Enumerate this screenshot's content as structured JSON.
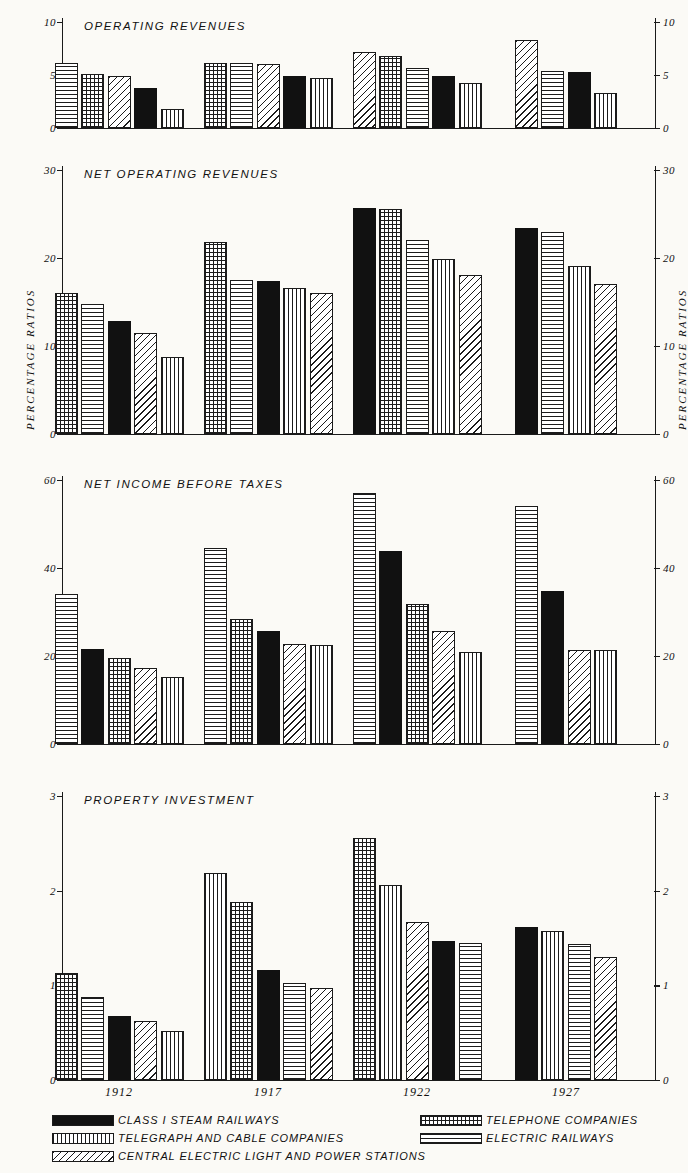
{
  "axis_titles": {
    "left": "PERCENTAGE  RATIOS",
    "right": "PERCENTAGE  RATIOS"
  },
  "years": [
    "1912",
    "1917",
    "1922",
    "1927"
  ],
  "legend": {
    "items": [
      {
        "key": "black",
        "pattern": "solid-black",
        "label": "CLASS I STEAM RAILWAYS"
      },
      {
        "key": "vert",
        "pattern": "vertical-lines",
        "label": "TELEGRAPH AND CABLE COMPANIES"
      },
      {
        "key": "diag",
        "pattern": "diagonal-hatch",
        "label": "CENTRAL ELECTRIC LIGHT AND POWER STATIONS"
      },
      {
        "key": "check",
        "pattern": "checkered",
        "label": "TELEPHONE COMPANIES"
      },
      {
        "key": "horz",
        "pattern": "horizontal-lines",
        "label": "ELECTRIC RAILWAYS"
      }
    ]
  },
  "chart_data": [
    {
      "type": "bar",
      "title": "OPERATING REVENUES",
      "xlabel": "",
      "ylabel": "PERCENTAGE RATIOS",
      "ylim": [
        0,
        10
      ],
      "yticks": [
        0,
        5,
        10
      ],
      "ytick_labels": [
        "0",
        "5",
        "10"
      ],
      "categories": [
        "1912",
        "1917",
        "1922",
        "1927"
      ],
      "groups": [
        {
          "year": "1912",
          "bars": [
            {
              "series": "ELECTRIC RAILWAYS",
              "pattern": "horz",
              "value": 6.1
            },
            {
              "series": "TELEPHONE COMPANIES",
              "pattern": "check",
              "value": 5.1
            },
            {
              "series": "CENTRAL ELECTRIC LIGHT AND POWER STATIONS",
              "pattern": "diag",
              "value": 4.95
            },
            {
              "series": "CLASS I STEAM RAILWAYS",
              "pattern": "black",
              "value": 3.8
            },
            {
              "series": "TELEGRAPH AND CABLE COMPANIES",
              "pattern": "vert",
              "value": 1.8
            }
          ]
        },
        {
          "year": "1917",
          "bars": [
            {
              "series": "TELEPHONE COMPANIES",
              "pattern": "check",
              "value": 6.15
            },
            {
              "series": "ELECTRIC RAILWAYS",
              "pattern": "horz",
              "value": 6.1
            },
            {
              "series": "CENTRAL ELECTRIC LIGHT AND POWER STATIONS",
              "pattern": "diag",
              "value": 6.05
            },
            {
              "series": "CLASS I STEAM RAILWAYS",
              "pattern": "black",
              "value": 4.9
            },
            {
              "series": "TELEGRAPH AND CABLE COMPANIES",
              "pattern": "vert",
              "value": 4.75
            }
          ]
        },
        {
          "year": "1922",
          "bars": [
            {
              "series": "CENTRAL ELECTRIC LIGHT AND POWER STATIONS",
              "pattern": "diag",
              "value": 7.2
            },
            {
              "series": "TELEPHONE COMPANIES",
              "pattern": "check",
              "value": 6.8
            },
            {
              "series": "ELECTRIC RAILWAYS",
              "pattern": "horz",
              "value": 5.7
            },
            {
              "series": "CLASS I STEAM RAILWAYS",
              "pattern": "black",
              "value": 4.9
            },
            {
              "series": "TELEGRAPH AND CABLE COMPANIES",
              "pattern": "vert",
              "value": 4.2
            }
          ]
        },
        {
          "year": "1927",
          "bars": [
            {
              "series": "CENTRAL ELECTRIC LIGHT AND POWER STATIONS",
              "pattern": "diag",
              "value": 8.3
            },
            {
              "series": "ELECTRIC RAILWAYS",
              "pattern": "horz",
              "value": 5.4
            },
            {
              "series": "CLASS I STEAM RAILWAYS",
              "pattern": "black",
              "value": 5.3
            },
            {
              "series": "TELEGRAPH AND CABLE COMPANIES",
              "pattern": "vert",
              "value": 3.3
            }
          ]
        }
      ]
    },
    {
      "type": "bar",
      "title": "NET OPERATING REVENUES",
      "xlabel": "",
      "ylabel": "PERCENTAGE RATIOS",
      "ylim": [
        0,
        30
      ],
      "yticks": [
        0,
        10,
        20,
        30
      ],
      "ytick_labels": [
        "0",
        "10",
        "20",
        "30"
      ],
      "categories": [
        "1912",
        "1917",
        "1922",
        "1927"
      ],
      "groups": [
        {
          "year": "1912",
          "bars": [
            {
              "series": "TELEPHONE COMPANIES",
              "pattern": "check",
              "value": 16.0
            },
            {
              "series": "ELECTRIC RAILWAYS",
              "pattern": "horz",
              "value": 14.8
            },
            {
              "series": "CLASS I STEAM RAILWAYS",
              "pattern": "black",
              "value": 12.8
            },
            {
              "series": "CENTRAL ELECTRIC LIGHT AND POWER STATIONS",
              "pattern": "diag",
              "value": 11.5
            },
            {
              "series": "TELEGRAPH AND CABLE COMPANIES",
              "pattern": "vert",
              "value": 8.8
            }
          ]
        },
        {
          "year": "1917",
          "bars": [
            {
              "series": "TELEPHONE COMPANIES",
              "pattern": "check",
              "value": 21.8
            },
            {
              "series": "ELECTRIC RAILWAYS",
              "pattern": "horz",
              "value": 17.5
            },
            {
              "series": "CLASS I STEAM RAILWAYS",
              "pattern": "black",
              "value": 17.4
            },
            {
              "series": "TELEGRAPH AND CABLE COMPANIES",
              "pattern": "vert",
              "value": 16.6
            },
            {
              "series": "CENTRAL ELECTRIC LIGHT AND POWER STATIONS",
              "pattern": "diag",
              "value": 16.0
            }
          ]
        },
        {
          "year": "1922",
          "bars": [
            {
              "series": "CLASS I STEAM RAILWAYS",
              "pattern": "black",
              "value": 25.7
            },
            {
              "series": "TELEPHONE COMPANIES",
              "pattern": "check",
              "value": 25.6
            },
            {
              "series": "ELECTRIC RAILWAYS",
              "pattern": "horz",
              "value": 22.1
            },
            {
              "series": "TELEGRAPH AND CABLE COMPANIES",
              "pattern": "vert",
              "value": 19.9
            },
            {
              "series": "CENTRAL ELECTRIC LIGHT AND POWER STATIONS",
              "pattern": "diag",
              "value": 18.1
            }
          ]
        },
        {
          "year": "1927",
          "bars": [
            {
              "series": "CLASS I STEAM RAILWAYS",
              "pattern": "black",
              "value": 23.4
            },
            {
              "series": "ELECTRIC RAILWAYS",
              "pattern": "horz",
              "value": 22.9
            },
            {
              "series": "TELEGRAPH AND CABLE COMPANIES",
              "pattern": "vert",
              "value": 19.1
            },
            {
              "series": "CENTRAL ELECTRIC LIGHT AND POWER STATIONS",
              "pattern": "diag",
              "value": 17.0
            }
          ]
        }
      ]
    },
    {
      "type": "bar",
      "title": "NET INCOME BEFORE TAXES",
      "xlabel": "",
      "ylabel": "PERCENTAGE RATIOS",
      "ylim": [
        0,
        60
      ],
      "yticks": [
        0,
        20,
        40,
        60
      ],
      "ytick_labels": [
        "0",
        "20",
        "40",
        "60"
      ],
      "categories": [
        "1912",
        "1917",
        "1922",
        "1927"
      ],
      "groups": [
        {
          "year": "1912",
          "bars": [
            {
              "series": "ELECTRIC RAILWAYS",
              "pattern": "horz",
              "value": 34.0
            },
            {
              "series": "CLASS I STEAM RAILWAYS",
              "pattern": "black",
              "value": 21.5
            },
            {
              "series": "TELEPHONE COMPANIES",
              "pattern": "check",
              "value": 19.5
            },
            {
              "series": "CENTRAL ELECTRIC LIGHT AND POWER STATIONS",
              "pattern": "diag",
              "value": 17.2
            },
            {
              "series": "TELEGRAPH AND CABLE COMPANIES",
              "pattern": "vert",
              "value": 15.2
            }
          ]
        },
        {
          "year": "1917",
          "bars": [
            {
              "series": "ELECTRIC RAILWAYS",
              "pattern": "horz",
              "value": 44.5
            },
            {
              "series": "TELEPHONE COMPANIES",
              "pattern": "check",
              "value": 28.5
            },
            {
              "series": "CLASS I STEAM RAILWAYS",
              "pattern": "black",
              "value": 25.7
            },
            {
              "series": "CENTRAL ELECTRIC LIGHT AND POWER STATIONS",
              "pattern": "diag",
              "value": 22.7
            },
            {
              "series": "TELEGRAPH AND CABLE COMPANIES",
              "pattern": "vert",
              "value": 22.4
            }
          ]
        },
        {
          "year": "1922",
          "bars": [
            {
              "series": "ELECTRIC RAILWAYS",
              "pattern": "horz",
              "value": 57.0
            },
            {
              "series": "CLASS I STEAM RAILWAYS",
              "pattern": "black",
              "value": 43.8
            },
            {
              "series": "TELEPHONE COMPANIES",
              "pattern": "check",
              "value": 31.8
            },
            {
              "series": "CENTRAL ELECTRIC LIGHT AND POWER STATIONS",
              "pattern": "diag",
              "value": 25.7
            },
            {
              "series": "TELEGRAPH AND CABLE COMPANIES",
              "pattern": "vert",
              "value": 21.0
            }
          ]
        },
        {
          "year": "1927",
          "bars": [
            {
              "series": "ELECTRIC RAILWAYS",
              "pattern": "horz",
              "value": 54.0
            },
            {
              "series": "CLASS I STEAM RAILWAYS",
              "pattern": "black",
              "value": 34.8
            },
            {
              "series": "CENTRAL ELECTRIC LIGHT AND POWER STATIONS",
              "pattern": "diag",
              "value": 21.4
            },
            {
              "series": "TELEGRAPH AND CABLE COMPANIES",
              "pattern": "vert",
              "value": 21.3
            }
          ]
        }
      ]
    },
    {
      "type": "bar",
      "title": "PROPERTY INVESTMENT",
      "xlabel": "",
      "ylabel": "PERCENTAGE RATIOS",
      "ylim": [
        0,
        3
      ],
      "yticks": [
        0,
        1,
        2,
        3
      ],
      "ytick_labels": [
        "0",
        "1",
        "2",
        "3"
      ],
      "categories": [
        "1912",
        "1917",
        "1922",
        "1927"
      ],
      "groups": [
        {
          "year": "1912",
          "bars": [
            {
              "series": "TELEPHONE COMPANIES",
              "pattern": "check",
              "value": 1.13
            },
            {
              "series": "ELECTRIC RAILWAYS",
              "pattern": "horz",
              "value": 0.88
            },
            {
              "series": "CLASS I STEAM RAILWAYS",
              "pattern": "black",
              "value": 0.68
            },
            {
              "series": "CENTRAL ELECTRIC LIGHT AND POWER STATIONS",
              "pattern": "diag",
              "value": 0.62
            },
            {
              "series": "TELEGRAPH AND CABLE COMPANIES",
              "pattern": "vert",
              "value": 0.52
            }
          ]
        },
        {
          "year": "1917",
          "bars": [
            {
              "series": "TELEGRAPH AND CABLE COMPANIES",
              "pattern": "vert",
              "value": 2.19
            },
            {
              "series": "TELEPHONE COMPANIES",
              "pattern": "check",
              "value": 1.88
            },
            {
              "series": "CLASS I STEAM RAILWAYS",
              "pattern": "black",
              "value": 1.16
            },
            {
              "series": "ELECTRIC RAILWAYS",
              "pattern": "horz",
              "value": 1.02
            },
            {
              "series": "CENTRAL ELECTRIC LIGHT AND POWER STATIONS",
              "pattern": "diag",
              "value": 0.97
            }
          ]
        },
        {
          "year": "1922",
          "bars": [
            {
              "series": "TELEPHONE COMPANIES",
              "pattern": "check",
              "value": 2.56
            },
            {
              "series": "TELEGRAPH AND CABLE COMPANIES",
              "pattern": "vert",
              "value": 2.06
            },
            {
              "series": "CENTRAL ELECTRIC LIGHT AND POWER STATIONS",
              "pattern": "diag",
              "value": 1.67
            },
            {
              "series": "CLASS I STEAM RAILWAYS",
              "pattern": "black",
              "value": 1.47
            },
            {
              "series": "ELECTRIC RAILWAYS",
              "pattern": "horz",
              "value": 1.45
            }
          ]
        },
        {
          "year": "1927",
          "bars": [
            {
              "series": "CLASS I STEAM RAILWAYS",
              "pattern": "black",
              "value": 1.62
            },
            {
              "series": "TELEGRAPH AND CABLE COMPANIES",
              "pattern": "vert",
              "value": 1.57
            },
            {
              "series": "ELECTRIC RAILWAYS",
              "pattern": "horz",
              "value": 1.44
            },
            {
              "series": "CENTRAL ELECTRIC LIGHT AND POWER STATIONS",
              "pattern": "diag",
              "value": 1.3
            }
          ]
        }
      ]
    }
  ]
}
